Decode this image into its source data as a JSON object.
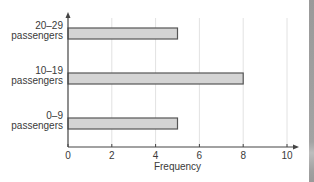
{
  "chart_data": {
    "type": "bar",
    "orientation": "horizontal",
    "title": "",
    "xlabel": "Frequency",
    "ylabel": "",
    "categories": [
      [
        "0–9",
        "passengers"
      ],
      [
        "10–19",
        "passengers"
      ],
      [
        "20–29",
        "passengers"
      ]
    ],
    "category_labels": [
      "0–9 passengers",
      "10–19 passengers",
      "20–29 passengers"
    ],
    "values": [
      5,
      8,
      5
    ],
    "xlim": [
      0,
      10
    ],
    "xticks": [
      0,
      2,
      4,
      6,
      8,
      10
    ],
    "grid": {
      "vertical": true,
      "horizontal": false
    },
    "legend": null
  },
  "style": {
    "bar_fill": "#d4d4d4",
    "bar_stroke": "#555555",
    "axis_color": "#444444",
    "grid_color": "#e2e2e2",
    "text_color": "#3a3a3a"
  },
  "layout": {
    "origin_x": 68,
    "axis_y": 147,
    "unit_px": 21.9,
    "axis_top": 12,
    "axis_right": 299,
    "bar_height": 11,
    "bar_tops": [
      118,
      73,
      28
    ]
  }
}
